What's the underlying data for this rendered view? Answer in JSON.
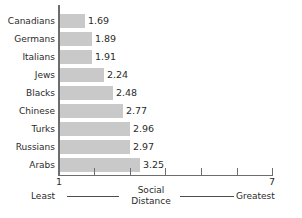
{
  "chart_data": {
    "type": "bar",
    "orientation": "horizontal",
    "title": "",
    "subtitle": "",
    "xlabel": "Social Distance",
    "ylabel": "",
    "xlim": [
      1,
      7
    ],
    "grid": false,
    "legend": null,
    "categories": [
      "Canadians",
      "Germans",
      "Italians",
      "Jews",
      "Blacks",
      "Chinese",
      "Turks",
      "Russians",
      "Arabs"
    ],
    "values": [
      1.69,
      1.89,
      1.91,
      2.24,
      2.48,
      2.77,
      2.96,
      2.97,
      3.25
    ],
    "value_labels": [
      "1.69",
      "1.89",
      "1.91",
      "2.24",
      "2.48",
      "2.77",
      "2.96",
      "2.97",
      "3.25"
    ],
    "x_tick_labels": [
      "1",
      "2",
      "3",
      "4",
      "5",
      "6",
      "7"
    ],
    "x_tick_labels_shown": [
      "1",
      "7"
    ],
    "x_axis_endpoint_low_label": "1",
    "x_axis_endpoint_high_label": "7",
    "x_axis_anchor_low": "Least",
    "x_axis_anchor_high": "Greatest",
    "axis_title_line1": "Social",
    "axis_title_line2": "Distance",
    "bar_color": "#c9c9c9",
    "axis_color": "#6d6d6d",
    "text_color": "#2b2b2b",
    "background_color": "#ffffff"
  },
  "rows": [
    {
      "label": "Canadians",
      "value": 1.69,
      "value_text": "1.69",
      "bar_px": 25
    },
    {
      "label": "Germans",
      "value": 1.89,
      "value_text": "1.89",
      "bar_px": 32
    },
    {
      "label": "Italians",
      "value": 1.91,
      "value_text": "1.91",
      "bar_px": 32
    },
    {
      "label": "Jews",
      "value": 2.24,
      "value_text": "2.24",
      "bar_px": 44
    },
    {
      "label": "Blacks",
      "value": 2.48,
      "value_text": "2.48",
      "bar_px": 53
    },
    {
      "label": "Chinese",
      "value": 2.77,
      "value_text": "2.77",
      "bar_px": 63
    },
    {
      "label": "Turks",
      "value": 2.96,
      "value_text": "2.96",
      "bar_px": 70
    },
    {
      "label": "Russians",
      "value": 2.97,
      "value_text": "2.97",
      "bar_px": 70
    },
    {
      "label": "Arabs",
      "value": 3.25,
      "value_text": "3.25",
      "bar_px": 80
    }
  ],
  "ticks": [
    {
      "label": "1",
      "px": 0
    },
    {
      "label": "2",
      "px": 36
    },
    {
      "label": "3",
      "px": 72
    },
    {
      "label": "4",
      "px": 107
    },
    {
      "label": "5",
      "px": 143
    },
    {
      "label": "6",
      "px": 179
    },
    {
      "label": "7",
      "px": 214
    }
  ]
}
